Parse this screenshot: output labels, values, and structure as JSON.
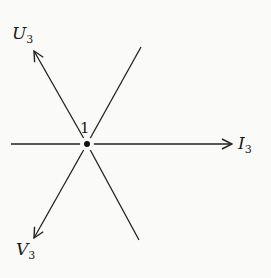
{
  "diagram": {
    "center_node": {
      "label": "1",
      "x": 87,
      "y": 144
    },
    "vectors": [
      {
        "name": "U",
        "subscript": "3",
        "direction": "upper-left",
        "arrow": true
      },
      {
        "name": "I",
        "subscript": "3",
        "direction": "right",
        "arrow": true
      },
      {
        "name": "V",
        "subscript": "3",
        "direction": "lower-left",
        "arrow": true
      }
    ],
    "plain_lines": [
      {
        "direction": "left"
      },
      {
        "direction": "upper-right"
      },
      {
        "direction": "lower-right"
      }
    ],
    "colors": {
      "line": "#222222",
      "background": "#fafaf8"
    }
  }
}
